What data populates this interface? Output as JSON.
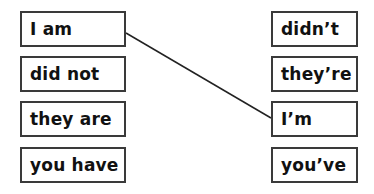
{
  "exercise": {
    "left_column": [
      {
        "label": "I am"
      },
      {
        "label": "did not"
      },
      {
        "label": "they are"
      },
      {
        "label": "you have"
      }
    ],
    "right_column": [
      {
        "label": "didn’t"
      },
      {
        "label": "they’re"
      },
      {
        "label": "I’m"
      },
      {
        "label": "you’ve"
      }
    ],
    "connections": [
      {
        "from": "I am",
        "to": "I’m"
      }
    ],
    "line_color": "#222222"
  }
}
